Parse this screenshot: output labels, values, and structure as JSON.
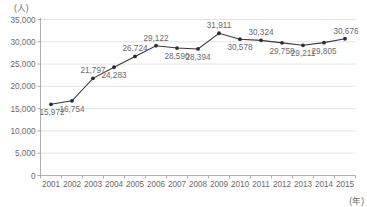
{
  "chart_data": {
    "type": "line",
    "title": "",
    "subtitle": "",
    "xlabel": "(年)",
    "ylabel": "(人)",
    "categories": [
      "2001",
      "2002",
      "2003",
      "2004",
      "2005",
      "2006",
      "2007",
      "2008",
      "2009",
      "2010",
      "2011",
      "2012",
      "2013",
      "2014",
      "2015"
    ],
    "values": [
      15972,
      16754,
      21797,
      24283,
      26724,
      29122,
      28590,
      28394,
      31911,
      30578,
      30324,
      29758,
      29211,
      29805,
      30676
    ],
    "point_labels": [
      "15,972",
      "16,754",
      "21,797",
      "24,283",
      "26,724",
      "29,122",
      "28,590",
      "28,394",
      "31,911",
      "30,578",
      "30,324",
      "29,758",
      "29,211",
      "29,805",
      "30,676"
    ],
    "label_positions": [
      "below",
      "below",
      "above",
      "below",
      "above",
      "above",
      "below",
      "below",
      "above",
      "below",
      "above",
      "below",
      "below",
      "below",
      "above"
    ],
    "ylim": [
      0,
      35000
    ],
    "ytick_values": [
      0,
      5000,
      10000,
      15000,
      20000,
      25000,
      30000,
      35000
    ],
    "ytick_labels": [
      "0",
      "5,000",
      "10,000",
      "15,000",
      "20,000",
      "25,000",
      "30,000",
      "35,000"
    ],
    "grid": "horizontal",
    "legend": "none",
    "series": [
      {
        "name": "",
        "values": [
          15972,
          16754,
          21797,
          24283,
          26724,
          29122,
          28590,
          28394,
          31911,
          30578,
          30324,
          29758,
          29211,
          29805,
          30676
        ]
      }
    ],
    "colors": {
      "line": "#3a3a3a",
      "marker": "#2e2e2e",
      "grid": "#d7d7d7",
      "axis": "#9a9a9a",
      "text": "#6b6b6b",
      "background": "#ffffff"
    }
  }
}
